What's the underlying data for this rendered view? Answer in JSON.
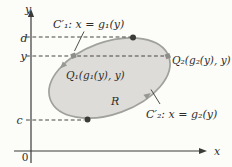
{
  "figure": {
    "colors": {
      "background": "#fcfcf9",
      "region_fill": "#dddcd8",
      "region_stroke": "#a0a09c",
      "axis": "#3a3a38",
      "dashed_line": "#454543",
      "dark_point": "#3b3b39",
      "gray_point": "#8d8d89",
      "direction_arrow": "#979793",
      "text": "#2d2d2b"
    },
    "labels": {
      "y_axis": "y",
      "x_axis": "x",
      "origin": "0",
      "d_tick": "d",
      "y_tick": "y",
      "c_tick": "c",
      "curve1": "C′₁:  x = g₁(y)",
      "curve2": "C′₂:  x = g₂(y)",
      "q1": "Q₁(g₁(y), y)",
      "q2": "Q₂(g₂(y), y)",
      "region": "R"
    }
  }
}
